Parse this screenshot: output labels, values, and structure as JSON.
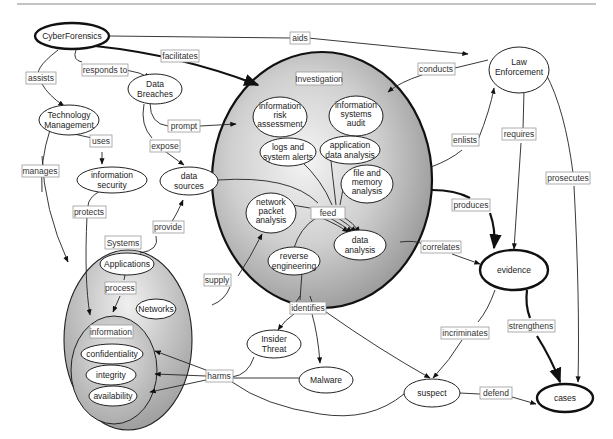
{
  "diagram": {
    "nodes": {
      "cyberforensics": "CyberForensics",
      "data_breaches": [
        "Data",
        "Breaches"
      ],
      "technology_management": [
        "Technology",
        "Management"
      ],
      "information_security": [
        "information",
        "security"
      ],
      "data_sources": [
        "data",
        "sources"
      ],
      "law_enforcement": [
        "Law",
        "Enforcement"
      ],
      "investigation": "Investigation",
      "information_risk_assessment": [
        "information",
        "risk",
        "assessment"
      ],
      "information_systems_audit": [
        "information",
        "systems",
        "audit"
      ],
      "logs_and_system_alerts": [
        "logs and",
        "system alerts"
      ],
      "application_data_analysis": [
        "application",
        "data analysis"
      ],
      "file_and_memory_analysis": [
        "file and",
        "memory",
        "analysis"
      ],
      "network_packet_analysis": [
        "network",
        "packet",
        "analysis"
      ],
      "data_analysis": [
        "data",
        "analysis"
      ],
      "reverse_engineering": [
        "reverse",
        "engineering"
      ],
      "systems": "Systems",
      "applications": "Applications",
      "networks": "Networks",
      "information": "information",
      "confidentiality": "confidentiality",
      "integrity": "integrity",
      "availability": "availability",
      "insider_threat": [
        "Insider",
        "Threat"
      ],
      "malware": "Malware",
      "evidence": "evidence",
      "suspect": "suspect",
      "cases": "cases"
    },
    "edge_labels": {
      "aids": "aids",
      "facilitates": "facilitates",
      "assists": "assists",
      "responds_to": "responds to",
      "conducts": "conducts",
      "uses": "uses",
      "prompt": "prompt",
      "expose": "expose",
      "manages": "manages",
      "enlists": "enlists",
      "requires": "requires",
      "prosecutes": "prosecutes",
      "protects": "protects",
      "provide": "provide",
      "feed": "feed",
      "produces": "produces",
      "correlates": "correlates",
      "process": "process",
      "supply": "supply",
      "identifies": "identifies",
      "incriminates": "incriminates",
      "strengthens": "strengthens",
      "harms": "harms",
      "defend": "defend"
    },
    "colors": {
      "container_fill_center": "#f2f2f2",
      "container_fill_edge": "#9c9c9c",
      "stroke": "#222222",
      "label_border": "#9a9a9a"
    }
  }
}
